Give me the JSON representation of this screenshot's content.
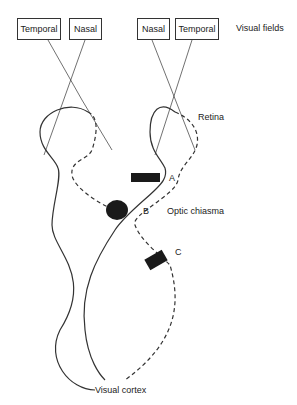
{
  "diagram": {
    "type": "visual pathway diagram",
    "left_eye_fields": [
      "Temporal",
      "Nasal"
    ],
    "right_eye_fields": [
      "Nasal",
      "Temporal"
    ],
    "labels": {
      "visual_fields": "Visual fields",
      "retina": "Retina",
      "lesion_a": "A",
      "lesion_b": "B",
      "optic_chiasma": "Optic chiasma",
      "lesion_c": "C",
      "visual_cortex": "Visual cortex"
    },
    "colors": {
      "line": "#333333",
      "lesion": "#1a1a1a"
    }
  }
}
